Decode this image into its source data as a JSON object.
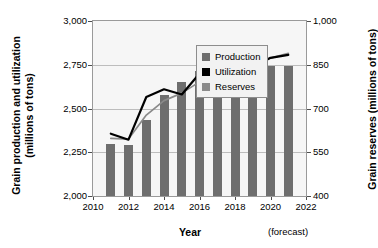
{
  "chart_data": {
    "type": "bar",
    "title": "",
    "xlabel": "Year",
    "xlabel_note": "(forecast)",
    "ylabel_left": "Grain production and utilization (millions of tons)",
    "ylabel_left_line1": "Grain production and utilization",
    "ylabel_left_line2": "(millions of tons)",
    "ylabel_right": "Grain reserves (millions of tons)",
    "ylim_left": [
      2000,
      3000
    ],
    "ylim_right": [
      400,
      1000
    ],
    "yticks_left": [
      "2,000",
      "2,250",
      "2,500",
      "2,750",
      "3,000"
    ],
    "yticks_left_values": [
      2000,
      2250,
      2500,
      2750,
      3000
    ],
    "yticks_right": [
      "400",
      "550",
      "700",
      "850",
      "1,000"
    ],
    "yticks_right_values": [
      400,
      550,
      700,
      850,
      1000
    ],
    "xticks": [
      "2010",
      "2012",
      "2014",
      "2016",
      "2018",
      "2020",
      "2022"
    ],
    "xticks_values": [
      2010,
      2012,
      2014,
      2016,
      2018,
      2020,
      2022
    ],
    "xlim": [
      2010,
      2022
    ],
    "grid": true,
    "legend_position": "upper-left",
    "categories": [
      2011,
      2012,
      2013,
      2014,
      2015,
      2016,
      2017,
      2018,
      2019,
      2020,
      2021
    ],
    "series": [
      {
        "name": "Production",
        "kind": "line",
        "axis": "left",
        "color": "#8a8a8a",
        "values": [
          2330,
          2325,
          2462,
          2545,
          2588,
          2652,
          2692,
          2722,
          2742,
          2788,
          2815
        ]
      },
      {
        "name": "Utilization",
        "kind": "line",
        "axis": "left",
        "color": "#000000",
        "values": [
          2356,
          2322,
          2566,
          2610,
          2580,
          2700,
          2714,
          2660,
          2736,
          2790,
          2806
        ]
      },
      {
        "name": "Reserves",
        "kind": "bar",
        "axis": "right",
        "color": "#6e6e6e",
        "values": [
          580,
          574,
          660,
          745,
          790,
          830,
          861,
          842,
          845,
          845,
          846
        ]
      }
    ]
  },
  "legend": {
    "items": [
      {
        "label": "Production",
        "color": "#6e6e6e"
      },
      {
        "label": "Utilization",
        "color": "#000000"
      },
      {
        "label": "Reserves",
        "color": "#8a8a8a"
      }
    ]
  }
}
